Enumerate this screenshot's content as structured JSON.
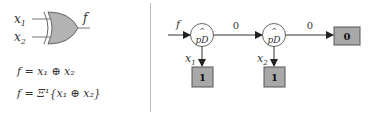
{
  "left_panel": {
    "gate": {
      "type": "XOR",
      "inputs": [
        "x1",
        "x2"
      ],
      "output": "f",
      "fill_color": "#b3b3b3",
      "stroke_color": "#555555"
    },
    "input_labels": {
      "x1_base": "x",
      "x1_sub": "1",
      "x2_base": "x",
      "x2_sub": "2"
    },
    "output_label": "f",
    "equations": [
      {
        "text": "f = x₁ ⊕ x₂"
      },
      {
        "text": "f = Ξ¹{x₁ ⊕ x₂}"
      }
    ]
  },
  "right_panel": {
    "input_label": "f",
    "nodes": [
      {
        "id": "node1",
        "top_symbol": "^",
        "label": "pD",
        "variable_base": "x",
        "variable_sub": "1"
      },
      {
        "id": "node2",
        "top_symbol": "^",
        "label": "pD",
        "variable_base": "x",
        "variable_sub": "2"
      }
    ],
    "edges": [
      {
        "from": "input",
        "to": "node1",
        "label": ""
      },
      {
        "from": "node1",
        "to": "node2",
        "label": "0"
      },
      {
        "from": "node2",
        "to": "term0",
        "label": "0"
      },
      {
        "from": "node1",
        "to": "term1a",
        "label": ""
      },
      {
        "from": "node2",
        "to": "term1b",
        "label": ""
      }
    ],
    "terminals": [
      {
        "id": "term1a",
        "value": "1"
      },
      {
        "id": "term1b",
        "value": "1"
      },
      {
        "id": "term0",
        "value": "0"
      }
    ],
    "colors": {
      "terminal_fill": "#a8a8a8",
      "terminal_stroke": "#555555",
      "line": "#333333",
      "node_stroke": "#555555"
    }
  }
}
